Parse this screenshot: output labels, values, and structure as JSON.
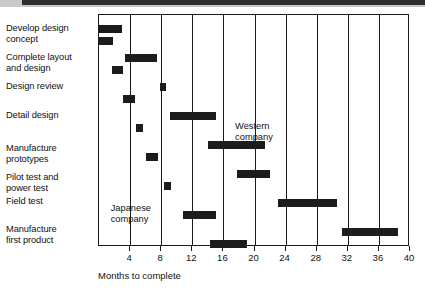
{
  "chart_data": {
    "type": "bar",
    "subtype": "gantt",
    "title": "",
    "xlabel": "Months to complete",
    "ylabel": "",
    "xlim": [
      0,
      40
    ],
    "xticks": [
      4,
      8,
      12,
      16,
      20,
      24,
      28,
      32,
      36,
      40
    ],
    "grid": true,
    "legend_position": "inline-annotation",
    "annotations": [
      {
        "text": "Western\ncompany",
        "line1": "Western",
        "line2": "company",
        "x_month": 17.5,
        "row": 3.6
      },
      {
        "text": "Japanese\ncompany",
        "line1": "Japanese",
        "line2": "company",
        "x_month": 1.5,
        "row": 6.4
      }
    ],
    "series": [
      {
        "name": "Japanese company",
        "note": "upper bar of each task pair"
      },
      {
        "name": "Western company",
        "note": "lower bar of each task pair"
      }
    ],
    "categories": [
      "Develop design concept",
      "Complete layout and design",
      "Design review",
      "Detail design",
      "Manufacture prototypes",
      "Pilot test and power test",
      "Field test",
      "Manufacture first product"
    ],
    "tasks": [
      {
        "label_line1": "Develop design",
        "label_line2": "concept",
        "japanese": {
          "start": 0.0,
          "end": 3.0
        },
        "western": {
          "start": 0.0,
          "end": 1.8
        }
      },
      {
        "label_line1": "Complete layout",
        "label_line2": "and design",
        "japanese": {
          "start": 3.3,
          "end": 7.4
        },
        "western": {
          "start": 1.7,
          "end": 3.1
        }
      },
      {
        "label_line1": "Design review",
        "label_line2": "",
        "japanese": {
          "start": 7.8,
          "end": 8.6
        },
        "western": {
          "start": 3.1,
          "end": 4.6
        }
      },
      {
        "label_line1": "Detail design",
        "label_line2": "",
        "japanese": {
          "start": 9.1,
          "end": 15.0
        },
        "western": {
          "start": 4.8,
          "end": 5.6
        }
      },
      {
        "label_line1": "Manufacture",
        "label_line2": "prototypes",
        "japanese": {
          "start": 14.0,
          "end": 21.3
        },
        "western": {
          "start": 6.0,
          "end": 7.6
        }
      },
      {
        "label_line1": "Pilot test and",
        "label_line2": "power test",
        "japanese": {
          "start": 17.8,
          "end": 22.0
        },
        "western": {
          "start": 8.3,
          "end": 9.2
        }
      },
      {
        "label_line1": "Field test",
        "label_line2": "",
        "japanese": {
          "start": 23.0,
          "end": 30.6
        },
        "western": {
          "start": 10.8,
          "end": 15.0
        }
      },
      {
        "label_line1": "Manufacture",
        "label_line2": "first product",
        "japanese": {
          "start": 31.3,
          "end": 38.4
        },
        "western": {
          "start": 14.3,
          "end": 19.0
        }
      }
    ]
  },
  "axis": {
    "title": "Months to complete",
    "tick_labels": [
      "4",
      "8",
      "12",
      "16",
      "20",
      "24",
      "28",
      "32",
      "36",
      "40"
    ]
  },
  "labels": {
    "task_0_line1": "Develop design",
    "task_0_line2": "concept",
    "task_1_line1": "Complete layout",
    "task_1_line2": "and design",
    "task_2_line1": "Design review",
    "task_3_line1": "Detail design",
    "task_4_line1": "Manufacture",
    "task_4_line2": "prototypes",
    "task_5_line1": "Pilot test and",
    "task_5_line2": "power test",
    "task_6_line1": "Field test",
    "task_7_line1": "Manufacture",
    "task_7_line2": "first product"
  },
  "annotations": {
    "western_line1": "Western",
    "western_line2": "company",
    "japanese_line1": "Japanese",
    "japanese_line2": "company"
  },
  "colors": {
    "bar": "#1c1c1c",
    "frame": "#1a1a1a",
    "text": "#111111",
    "background": "#ffffff"
  }
}
